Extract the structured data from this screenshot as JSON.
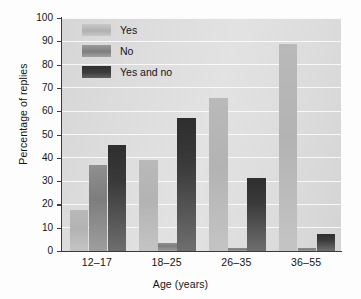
{
  "chart_data": {
    "type": "bar",
    "title": "",
    "xlabel": "Age (years)",
    "ylabel": "Percentage of replies",
    "categories": [
      "12–17",
      "18–25",
      "26–35",
      "36–55"
    ],
    "series": [
      {
        "name": "Yes",
        "values": [
          17.5,
          39,
          65.5,
          89
        ]
      },
      {
        "name": "No",
        "values": [
          37,
          3.5,
          1.5,
          1.5
        ]
      },
      {
        "name": "Yes and no",
        "values": [
          45.5,
          57,
          31.5,
          7.5
        ]
      }
    ],
    "ylim": [
      0,
      100
    ],
    "yticks": [
      0,
      10,
      20,
      30,
      40,
      50,
      60,
      70,
      80,
      90,
      100
    ],
    "ytick_labels": [
      "0",
      "10",
      "20",
      "30",
      "40",
      "50",
      "60",
      "70",
      "80",
      "90",
      "100"
    ],
    "grid": true,
    "legend_position": "top-left",
    "colors": {
      "yes": "#b5b5b5",
      "no": "#868686",
      "yes_and_no": "#373737",
      "plot_background": "#dcdcdc",
      "gridline": "#fafafa",
      "axis": "#3b3b3b",
      "text": "#141414"
    }
  }
}
